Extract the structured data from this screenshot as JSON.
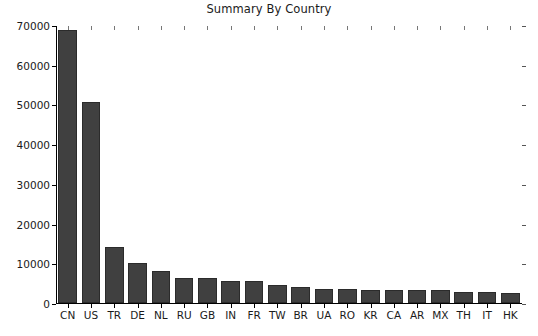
{
  "chart_data": {
    "type": "bar",
    "title": "Summary By Country",
    "xlabel": "",
    "ylabel": "",
    "categories": [
      "CN",
      "US",
      "TR",
      "DE",
      "NL",
      "RU",
      "GB",
      "IN",
      "FR",
      "TW",
      "BR",
      "UA",
      "RO",
      "KR",
      "CA",
      "AR",
      "MX",
      "TH",
      "IT",
      "HK"
    ],
    "values": [
      68800,
      50500,
      14000,
      10100,
      8000,
      6400,
      6400,
      5600,
      5500,
      4500,
      4000,
      3600,
      3500,
      3300,
      3300,
      3300,
      3200,
      2800,
      2700,
      2600
    ],
    "ylim": [
      0,
      70000
    ],
    "ytick_values": [
      0,
      10000,
      20000,
      30000,
      40000,
      50000,
      60000,
      70000
    ],
    "ytick_labels": [
      "0",
      "10000",
      "20000",
      "30000",
      "40000",
      "50000",
      "60000",
      "70000"
    ],
    "grid": false,
    "legend": null,
    "bar_color": "#404040",
    "bar_edge_color": "#2b2b2b",
    "background_color": "#ffffff",
    "ticks_all_sides": true
  },
  "figure": {
    "title": "Summary By Country"
  }
}
